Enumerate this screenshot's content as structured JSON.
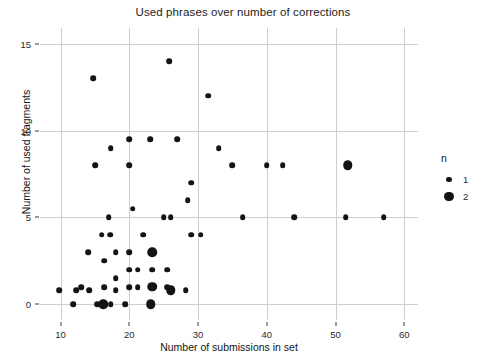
{
  "chart_data": {
    "type": "scatter",
    "title": "Used phrases over number of corrections",
    "xlabel": "Number of submissions in set",
    "ylabel": "Number of used fragments",
    "xlim": [
      7,
      62
    ],
    "ylim": [
      -0.9,
      15.9
    ],
    "xticks": [
      10,
      20,
      30,
      40,
      50,
      60
    ],
    "yticks": [
      0,
      5,
      10,
      15
    ],
    "grid": true,
    "legend": {
      "title": "n",
      "position": "right",
      "entries": [
        {
          "label": "1",
          "size": 1
        },
        {
          "label": "2",
          "size": 2
        }
      ]
    },
    "size_encoding": "n",
    "points": [
      {
        "x": 25.8,
        "y": 14,
        "n": 1
      },
      {
        "x": 14.7,
        "y": 13,
        "n": 1
      },
      {
        "x": 31.5,
        "y": 12,
        "n": 1
      },
      {
        "x": 20.0,
        "y": 9.5,
        "n": 1
      },
      {
        "x": 23.0,
        "y": 9.5,
        "n": 1
      },
      {
        "x": 27.0,
        "y": 9.5,
        "n": 1
      },
      {
        "x": 17.3,
        "y": 9,
        "n": 1
      },
      {
        "x": 33.0,
        "y": 9,
        "n": 1
      },
      {
        "x": 15.0,
        "y": 8,
        "n": 1
      },
      {
        "x": 20.0,
        "y": 8,
        "n": 1
      },
      {
        "x": 35.0,
        "y": 8,
        "n": 1
      },
      {
        "x": 40.0,
        "y": 8,
        "n": 1
      },
      {
        "x": 42.3,
        "y": 8,
        "n": 1
      },
      {
        "x": 51.8,
        "y": 8,
        "n": 2
      },
      {
        "x": 29.0,
        "y": 7,
        "n": 1
      },
      {
        "x": 28.5,
        "y": 6,
        "n": 1
      },
      {
        "x": 20.5,
        "y": 5.5,
        "n": 1
      },
      {
        "x": 25.0,
        "y": 5,
        "n": 1
      },
      {
        "x": 17.0,
        "y": 5,
        "n": 1
      },
      {
        "x": 26.0,
        "y": 5,
        "n": 1
      },
      {
        "x": 36.5,
        "y": 5,
        "n": 1
      },
      {
        "x": 44.0,
        "y": 5,
        "n": 1
      },
      {
        "x": 51.5,
        "y": 5,
        "n": 1
      },
      {
        "x": 57.0,
        "y": 5,
        "n": 1
      },
      {
        "x": 16.0,
        "y": 4,
        "n": 1
      },
      {
        "x": 17.2,
        "y": 4,
        "n": 1
      },
      {
        "x": 22.0,
        "y": 4,
        "n": 1
      },
      {
        "x": 29.0,
        "y": 4,
        "n": 1
      },
      {
        "x": 30.4,
        "y": 4,
        "n": 1
      },
      {
        "x": 14.0,
        "y": 3,
        "n": 1
      },
      {
        "x": 18.0,
        "y": 3,
        "n": 1
      },
      {
        "x": 20.0,
        "y": 3,
        "n": 1
      },
      {
        "x": 23.3,
        "y": 3,
        "n": 2
      },
      {
        "x": 16.3,
        "y": 2.5,
        "n": 1
      },
      {
        "x": 20.0,
        "y": 2,
        "n": 1
      },
      {
        "x": 21.2,
        "y": 2,
        "n": 1
      },
      {
        "x": 23.3,
        "y": 2,
        "n": 1
      },
      {
        "x": 25.5,
        "y": 2,
        "n": 1
      },
      {
        "x": 18.0,
        "y": 1.5,
        "n": 1
      },
      {
        "x": 13.0,
        "y": 1,
        "n": 1
      },
      {
        "x": 16.3,
        "y": 1,
        "n": 1
      },
      {
        "x": 20.0,
        "y": 1,
        "n": 1
      },
      {
        "x": 21.2,
        "y": 1,
        "n": 1
      },
      {
        "x": 23.3,
        "y": 1,
        "n": 2
      },
      {
        "x": 25.5,
        "y": 1,
        "n": 1
      },
      {
        "x": 18.0,
        "y": 0.8,
        "n": 1
      },
      {
        "x": 9.8,
        "y": 0.8,
        "n": 1
      },
      {
        "x": 12.3,
        "y": 0.8,
        "n": 1
      },
      {
        "x": 14.2,
        "y": 0.8,
        "n": 1
      },
      {
        "x": 26.0,
        "y": 0.8,
        "n": 2
      },
      {
        "x": 28.2,
        "y": 0.8,
        "n": 1
      },
      {
        "x": 11.8,
        "y": 0,
        "n": 1
      },
      {
        "x": 15.3,
        "y": 0,
        "n": 1
      },
      {
        "x": 16.2,
        "y": 0,
        "n": 2
      },
      {
        "x": 17.3,
        "y": 0,
        "n": 1
      },
      {
        "x": 19.4,
        "y": 0,
        "n": 1
      },
      {
        "x": 23.1,
        "y": 0,
        "n": 2
      }
    ]
  },
  "colors": {
    "point": "#141414",
    "grid": "#cfcfcf",
    "text": "#1a1a1a",
    "background": "#ffffff"
  }
}
